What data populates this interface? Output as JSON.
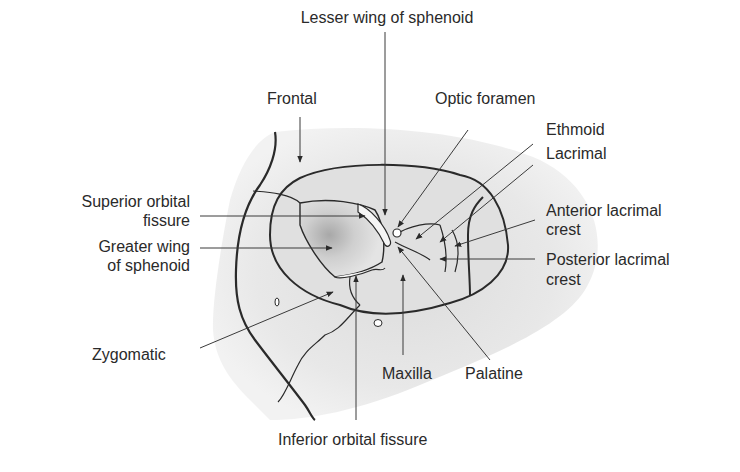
{
  "figure": {
    "colors": {
      "bone_fill": "#e6e6e6",
      "shadow": "#b8b8b8",
      "outline": "#2a2a2a",
      "leader": "#3a3a3a",
      "text": "#2a2a2a"
    }
  },
  "labels": {
    "lesser_wing": "Lesser wing of sphenoid",
    "frontal": "Frontal",
    "optic_foramen": "Optic foramen",
    "ethmoid": "Ethmoid",
    "lacrimal": "Lacrimal",
    "superior_orbital_fissure_1": "Superior orbital",
    "superior_orbital_fissure_2": "fissure",
    "greater_wing_1": "Greater wing",
    "greater_wing_2": "of sphenoid",
    "anterior_lacrimal_crest_1": "Anterior lacrimal",
    "anterior_lacrimal_crest_2": "crest",
    "posterior_lacrimal_crest_1": "Posterior lacrimal",
    "posterior_lacrimal_crest_2": "crest",
    "zygomatic": "Zygomatic",
    "maxilla": "Maxilla",
    "palatine": "Palatine",
    "inferior_orbital_fissure": "Inferior orbital fissure"
  }
}
